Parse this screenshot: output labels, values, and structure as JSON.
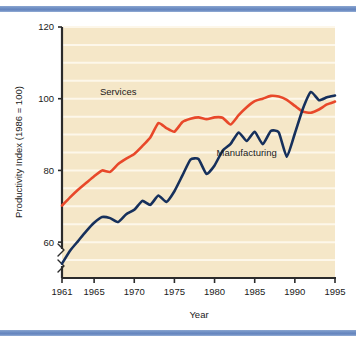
{
  "figure": {
    "background_color": "#ffffff",
    "band_color": "#6f8fc4",
    "plot_background_color": "#f5e7c8",
    "gridline_color": "#fdf7ea",
    "axis_color": "#2b2b2b"
  },
  "chart_data": {
    "type": "line",
    "title": "",
    "xlabel": "Year",
    "ylabel": "Productivity Index (1986 = 100)",
    "xlim": [
      1961,
      1995
    ],
    "ylim": [
      50,
      120
    ],
    "yaxis_break": true,
    "grid": true,
    "grid_axis": "y",
    "grid_step": 5,
    "legend_position": "inline-annotation",
    "xticks": [
      1961,
      1965,
      1970,
      1975,
      1980,
      1985,
      1990,
      1995
    ],
    "xtick_labels": [
      "1961",
      "1965",
      "1970",
      "1975",
      "1980",
      "1985",
      "1990",
      "1995"
    ],
    "yticks": [
      60,
      80,
      100,
      120
    ],
    "ytick_labels": [
      "60",
      "80",
      "100",
      "120"
    ],
    "x": [
      1961,
      1962,
      1963,
      1964,
      1965,
      1966,
      1967,
      1968,
      1969,
      1970,
      1971,
      1972,
      1973,
      1974,
      1975,
      1976,
      1977,
      1978,
      1979,
      1980,
      1981,
      1982,
      1983,
      1984,
      1985,
      1986,
      1987,
      1988,
      1989,
      1990,
      1991,
      1992,
      1993,
      1994,
      1995
    ],
    "series": [
      {
        "name": "Services",
        "color": "#e8482a",
        "label_x": 1968,
        "label_y": 101,
        "values": [
          70.2,
          72.5,
          74.6,
          76.5,
          78.4,
          80.0,
          79.6,
          81.8,
          83.3,
          84.6,
          86.8,
          89.2,
          93.2,
          91.8,
          90.8,
          93.5,
          94.4,
          94.8,
          94.3,
          94.8,
          94.7,
          92.8,
          95.4,
          97.6,
          99.3,
          100.0,
          100.8,
          100.6,
          99.7,
          98.0,
          96.4,
          96.1,
          97.0,
          98.4,
          99.2
        ]
      },
      {
        "name": "Manufacturing",
        "color": "#16305c",
        "label_x": 1984,
        "label_y": 84,
        "values": [
          54.0,
          57.6,
          60.3,
          63.0,
          65.4,
          67.0,
          66.7,
          65.6,
          67.8,
          69.0,
          71.5,
          70.4,
          73.0,
          71.2,
          74.2,
          78.6,
          83.0,
          83.2,
          79.0,
          81.4,
          85.5,
          87.4,
          90.6,
          88.2,
          90.8,
          87.3,
          91.0,
          90.6,
          83.8,
          90.3,
          97.2,
          101.9,
          99.6,
          100.4,
          100.9
        ]
      }
    ],
    "series_extra_right": {
      "Manufacturing": {
        "x": [
          1985,
          1986,
          1987,
          1988,
          1989,
          1990,
          1991,
          1992,
          1993,
          1994,
          1995
        ],
        "values": [
          101.9,
          100.4,
          100.6,
          100.5,
          98.6,
          95.0,
          92.0,
          92.3,
          95.5,
          100.2,
          104.3
        ]
      }
    }
  }
}
